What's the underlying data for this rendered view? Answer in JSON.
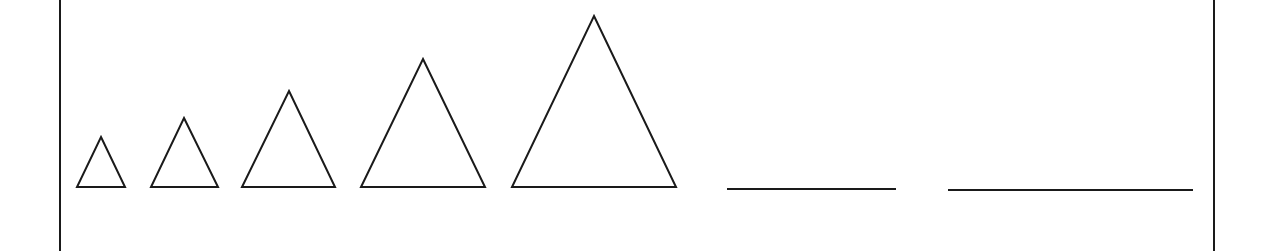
{
  "diagram": {
    "stroke_color": "#1a1a1a",
    "background": "#ffffff",
    "frame": {
      "left_x": 60,
      "right_x": 1214
    },
    "triangles": [
      {
        "index": 1,
        "apex": [
          101,
          137
        ],
        "base_left": [
          77,
          187
        ],
        "base_right": [
          125,
          187
        ]
      },
      {
        "index": 2,
        "apex": [
          184,
          118
        ],
        "base_left": [
          151,
          187
        ],
        "base_right": [
          218,
          187
        ]
      },
      {
        "index": 3,
        "apex": [
          289,
          91
        ],
        "base_left": [
          242,
          187
        ],
        "base_right": [
          335,
          187
        ]
      },
      {
        "index": 4,
        "apex": [
          423,
          59
        ],
        "base_left": [
          361,
          187
        ],
        "base_right": [
          485,
          187
        ]
      },
      {
        "index": 5,
        "apex": [
          594,
          16
        ],
        "base_left": [
          512,
          187
        ],
        "base_right": [
          676,
          187
        ]
      }
    ],
    "answer_lines": [
      {
        "index": 1,
        "x1": 727,
        "x2": 896,
        "y": 189
      },
      {
        "index": 2,
        "x1": 948,
        "x2": 1193,
        "y": 190
      }
    ]
  }
}
